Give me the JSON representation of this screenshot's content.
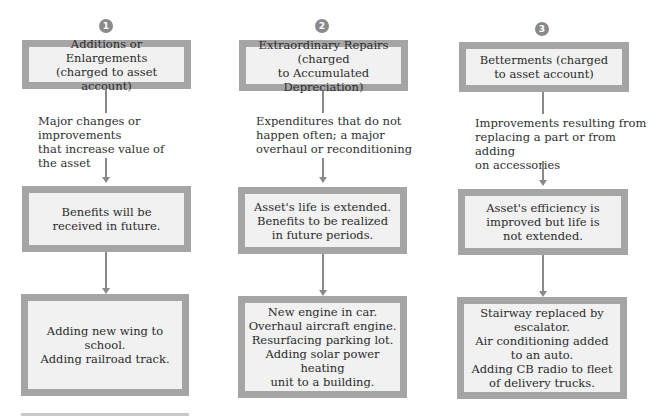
{
  "columns": [
    {
      "number": "1",
      "header": "Additions or Enlargements\n(charged to asset account)",
      "description": "Major changes or improvements\nthat increase value of\nthe asset",
      "effect": "Benefits will be\nreceived in future.",
      "examples": "Adding new wing to school.\nAdding railroad track."
    },
    {
      "number": "2",
      "header": "Extraordinary Repairs (charged\nto Accumulated Depreciation)",
      "description": "Expenditures that do not\nhappen often; a major\noverhaul or reconditioning",
      "effect": "Asset's life is extended.\nBenefits to be realized\nin future periods.",
      "examples": "New engine in car.\nOverhaul aircraft engine.\nResurfacing parking lot.\nAdding solar power heating\nunit to a building."
    },
    {
      "number": "3",
      "header": "Betterments (charged\nto asset account)",
      "description": "Improvements resulting from\nreplacing a part or from adding\non accessories",
      "effect": "Asset's efficiency is\nimproved but life is\nnot extended.",
      "examples": "Stairway replaced by\nescalator.\nAir conditioning added\nto an auto.\nAdding CB radio to fleet\nof delivery trucks."
    }
  ],
  "colors": {
    "box_border": "#a5a5a5",
    "box_fill": "#f1f1f1",
    "connector": "#8a8a8a"
  }
}
